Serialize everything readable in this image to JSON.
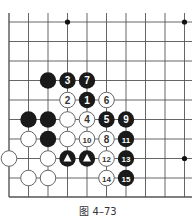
{
  "figure": {
    "caption": "图 4–73",
    "line_color": "#555555",
    "black_stone_color": "#1a1a1a",
    "white_stone_color": "#ffffff"
  },
  "board": {
    "cols": 10,
    "rows": 10,
    "x0": 9,
    "y0": 22,
    "spacing": 19.5,
    "star_points": [
      [
        3,
        0
      ],
      [
        9,
        0
      ],
      [
        9,
        7
      ]
    ],
    "stones": [
      {
        "col": 2,
        "row": 3,
        "color": "black",
        "label": ""
      },
      {
        "col": 3,
        "row": 3,
        "color": "black",
        "label": "3"
      },
      {
        "col": 4,
        "row": 3,
        "color": "black",
        "label": "7"
      },
      {
        "col": 3,
        "row": 4,
        "color": "white",
        "label": "2"
      },
      {
        "col": 4,
        "row": 4,
        "color": "black",
        "label": "1"
      },
      {
        "col": 5,
        "row": 4,
        "color": "white",
        "label": "6"
      },
      {
        "col": 1,
        "row": 5,
        "color": "black",
        "label": ""
      },
      {
        "col": 2,
        "row": 5,
        "color": "black",
        "label": ""
      },
      {
        "col": 3,
        "row": 5,
        "color": "white",
        "label": ""
      },
      {
        "col": 4,
        "row": 5,
        "color": "white",
        "label": "4"
      },
      {
        "col": 5,
        "row": 5,
        "color": "black",
        "label": "5"
      },
      {
        "col": 6,
        "row": 5,
        "color": "black",
        "label": "9"
      },
      {
        "col": 1,
        "row": 6,
        "color": "white",
        "label": ""
      },
      {
        "col": 2,
        "row": 6,
        "color": "black",
        "label": ""
      },
      {
        "col": 3,
        "row": 6,
        "color": "white",
        "label": ""
      },
      {
        "col": 4,
        "row": 6,
        "color": "white",
        "label": "10"
      },
      {
        "col": 5,
        "row": 6,
        "color": "white",
        "label": "8"
      },
      {
        "col": 6,
        "row": 6,
        "color": "black",
        "label": "11"
      },
      {
        "col": 0,
        "row": 7,
        "color": "white",
        "label": ""
      },
      {
        "col": 2,
        "row": 7,
        "color": "white",
        "label": ""
      },
      {
        "col": 3,
        "row": 7,
        "color": "black",
        "label": "▲"
      },
      {
        "col": 4,
        "row": 7,
        "color": "black",
        "label": "▲"
      },
      {
        "col": 5,
        "row": 7,
        "color": "white",
        "label": "12"
      },
      {
        "col": 6,
        "row": 7,
        "color": "black",
        "label": "13"
      },
      {
        "col": 1,
        "row": 8,
        "color": "white",
        "label": ""
      },
      {
        "col": 2,
        "row": 8,
        "color": "white",
        "label": ""
      },
      {
        "col": 5,
        "row": 8,
        "color": "white",
        "label": "14"
      },
      {
        "col": 6,
        "row": 8,
        "color": "black",
        "label": "15"
      }
    ]
  }
}
